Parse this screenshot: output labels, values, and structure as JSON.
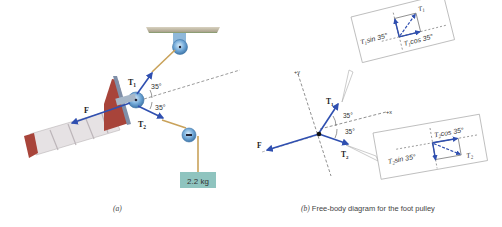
{
  "panel_a": {
    "caption_letter": "(a)",
    "labels": {
      "force_f": "F",
      "tension_1": "T",
      "tension_1_sub": "1",
      "tension_2": "T",
      "tension_2_sub": "2",
      "angle_upper": "35°",
      "angle_lower": "35°",
      "mass": "2.2 kg"
    }
  },
  "panel_b": {
    "caption_letter": "(b)",
    "caption_text": "Free-body diagram for the foot pulley",
    "axes": {
      "y_label": "+y",
      "x_label": "+x"
    },
    "labels": {
      "force_f": "F",
      "tension_1": "T",
      "tension_1_sub": "1",
      "tension_2": "T",
      "tension_2_sub": "2",
      "angle_upper": "35°",
      "angle_lower": "35°"
    },
    "inset_1": {
      "vector": "T",
      "vector_sub": "1",
      "sin_component": "sin 35°",
      "cos_component": "cos 35°",
      "sin_prefix": "T",
      "sin_prefix_sub": "1",
      "cos_prefix": "T",
      "cos_prefix_sub": "1"
    },
    "inset_2": {
      "vector": "T",
      "vector_sub": "2",
      "sin_component": "sin 35°",
      "cos_component": "cos 35°",
      "sin_prefix": "T",
      "sin_prefix_sub": "2",
      "cos_prefix": "T",
      "cos_prefix_sub": "2"
    }
  },
  "colors": {
    "vector_blue": "#2f4fb0",
    "rope": "#c9a25a",
    "pulley": "#6ea6d6",
    "weight_box": "#8fc4bf",
    "ceiling": "#a8a08a",
    "leg_red": "#a8443a",
    "bandage": "#e8e4e6"
  }
}
